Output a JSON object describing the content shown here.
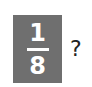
{
  "fraction_tile": {
    "numerator": "1",
    "denominator": "8",
    "background_color": "#6f6f6f"
  },
  "question_mark": "?"
}
